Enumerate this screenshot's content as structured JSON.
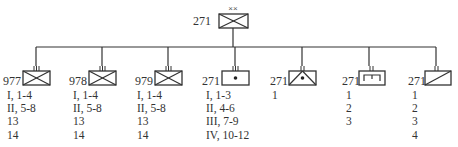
{
  "diagram": {
    "type": "military organization chart (orbat)",
    "headquarters": {
      "designation": "271",
      "echelon": "XX",
      "symbol": "armored-infantry-icon"
    },
    "subordinates": [
      {
        "designation": "977",
        "echelon": "III",
        "symbol": "armored-infantry-icon",
        "rows": [
          "I, 1-4",
          "II, 5-8",
          "13",
          "14"
        ]
      },
      {
        "designation": "978",
        "echelon": "III",
        "symbol": "armored-infantry-icon",
        "rows": [
          "I, 1-4",
          "II, 5-8",
          "13",
          "14"
        ]
      },
      {
        "designation": "979",
        "echelon": "III",
        "symbol": "armored-infantry-icon",
        "rows": [
          "I, 1-4",
          "II, 5-8",
          "13",
          "14"
        ]
      },
      {
        "designation": "271",
        "echelon": "III",
        "symbol": "artillery-icon",
        "rows": [
          "I, 1-3",
          "II, 4-6",
          "III, 7-9",
          "IV, 10-12"
        ]
      },
      {
        "designation": "271",
        "echelon": "II",
        "symbol": "air-defense-artillery-icon",
        "rows": [
          "1"
        ]
      },
      {
        "designation": "271",
        "echelon": "II",
        "symbol": "engineer-icon",
        "rows": [
          "1",
          "2",
          "3"
        ]
      },
      {
        "designation": "271",
        "echelon": "II",
        "symbol": "reconnaissance-icon",
        "rows": [
          "1",
          "2",
          "3",
          "4"
        ]
      }
    ]
  }
}
